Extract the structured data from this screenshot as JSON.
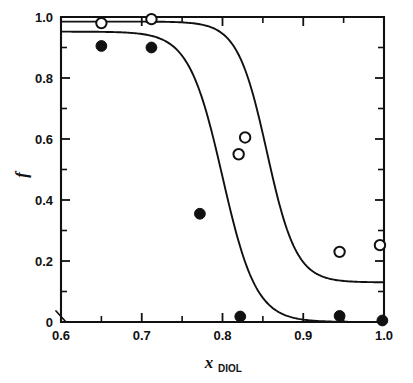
{
  "chart_data": {
    "type": "scatter",
    "title": "",
    "subtitle": "",
    "xlabel": "x",
    "xlabel_subscript": "DIOL",
    "ylabel": "f",
    "xlim": [
      0.6,
      1.0
    ],
    "ylim": [
      0.0,
      1.0
    ],
    "grid": false,
    "legend_position": "none",
    "xticks": [
      0.6,
      0.7,
      0.8,
      0.9,
      1.0
    ],
    "xtick_labels": [
      "0.6",
      "0.7",
      "0.8",
      "0.9",
      "1.0"
    ],
    "xticks_minor": [
      0.65,
      0.75,
      0.85,
      0.95
    ],
    "yticks": [
      0.0,
      0.2,
      0.4,
      0.6,
      0.8,
      1.0
    ],
    "ytick_labels": [
      "0",
      "0.2",
      "0.4",
      "0.6",
      "0.8",
      "1.0"
    ],
    "yticks_minor": [
      0.1,
      0.3,
      0.5,
      0.7,
      0.9
    ],
    "axis_break_near_origin": true,
    "series": [
      {
        "name": "open-circles",
        "marker": "open-circle",
        "color": "#111111",
        "points": [
          {
            "x": 0.65,
            "y": 0.98
          },
          {
            "x": 0.712,
            "y": 0.993
          },
          {
            "x": 0.82,
            "y": 0.55
          },
          {
            "x": 0.828,
            "y": 0.605
          },
          {
            "x": 0.945,
            "y": 0.23
          },
          {
            "x": 0.995,
            "y": 0.252
          }
        ]
      },
      {
        "name": "filled-circles",
        "marker": "filled-circle",
        "color": "#111111",
        "points": [
          {
            "x": 0.65,
            "y": 0.905
          },
          {
            "x": 0.712,
            "y": 0.9
          },
          {
            "x": 0.772,
            "y": 0.355
          },
          {
            "x": 0.822,
            "y": 0.018
          },
          {
            "x": 0.945,
            "y": 0.02
          },
          {
            "x": 0.998,
            "y": 0.005
          }
        ]
      }
    ],
    "fit_curves": [
      {
        "name": "upper-sigmoid-fit",
        "description": "Sigmoid fit through open circles; midpoint near x=0.855, high plateau 0.985, low plateau 0.130",
        "top": 0.985,
        "bottom": 0.13,
        "midpoint": 0.855,
        "steepness": 55
      },
      {
        "name": "lower-sigmoid-fit",
        "description": "Sigmoid fit through filled circles; midpoint near x=0.800, high plateau 0.950, low plateau 0.000",
        "top": 0.952,
        "bottom": 0.0,
        "midpoint": 0.8,
        "steepness": 48
      }
    ]
  }
}
